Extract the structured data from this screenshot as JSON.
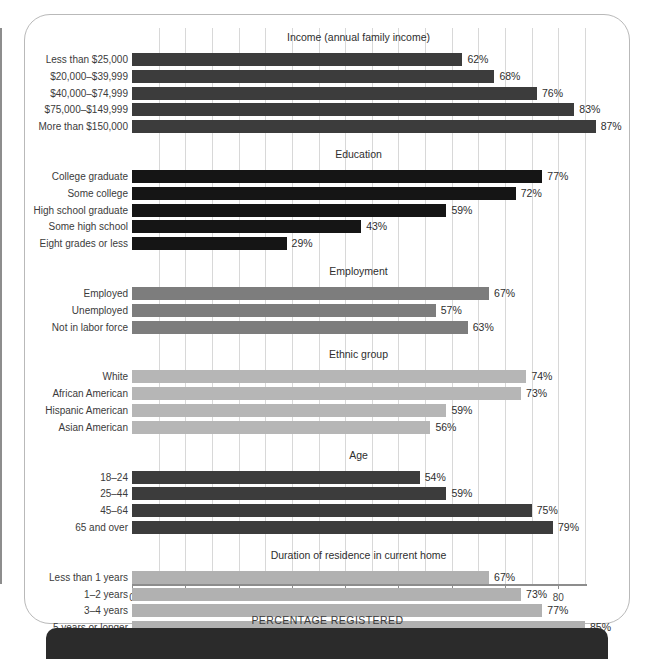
{
  "chart_data": {
    "type": "bar",
    "title": "",
    "xlabel": "PERCENTAGE REGISTERED",
    "ylabel": "",
    "xlim": [
      0,
      85
    ],
    "xticks": [
      0,
      10,
      20,
      30,
      40,
      50,
      60,
      70,
      80
    ],
    "xtick_labels": [
      "0",
      "10",
      "20",
      "30",
      "40",
      "50",
      "60",
      "70",
      "80"
    ],
    "minor_tick_step": 5,
    "grid": true,
    "orientation": "horizontal",
    "legend": "none",
    "value_suffix": "%",
    "groups": [
      {
        "name": "Income (annual family income)",
        "color": "#3c3c3c",
        "categories": [
          "Less than $25,000",
          "$20,000–$39,999",
          "$40,000–$74,999",
          "$75,000–$149,999",
          "More than $150,000"
        ],
        "values": [
          62,
          68,
          76,
          83,
          87
        ],
        "labels": [
          "62%",
          "68%",
          "76%",
          "83%",
          "87%"
        ]
      },
      {
        "name": "Education",
        "color": "#151515",
        "categories": [
          "College graduate",
          "Some college",
          "High school graduate",
          "Some high school",
          "Eight grades or less"
        ],
        "values": [
          77,
          72,
          59,
          43,
          29
        ],
        "labels": [
          "77%",
          "72%",
          "59%",
          "43%",
          "29%"
        ]
      },
      {
        "name": "Employment",
        "color": "#7d7d7d",
        "categories": [
          "Employed",
          "Unemployed",
          "Not in labor force"
        ],
        "values": [
          67,
          57,
          63
        ],
        "labels": [
          "67%",
          "57%",
          "63%"
        ]
      },
      {
        "name": "Ethnic group",
        "color": "#b6b6b6",
        "categories": [
          "White",
          "African American",
          "Hispanic American",
          "Asian American"
        ],
        "values": [
          74,
          73,
          59,
          56
        ],
        "labels": [
          "74%",
          "73%",
          "59%",
          "56%"
        ]
      },
      {
        "name": "Age",
        "color": "#3c3c3c",
        "categories": [
          "18–24",
          "25–44",
          "45–64",
          "65 and over"
        ],
        "values": [
          54,
          59,
          75,
          79
        ],
        "labels": [
          "54%",
          "59%",
          "75%",
          "79%"
        ]
      },
      {
        "name": "Duration of residence in current home",
        "color": "#b1b1b1",
        "categories": [
          "Less than 1 years",
          "1–2 years",
          "3–4 years",
          "5 years or longer"
        ],
        "values": [
          67,
          73,
          77,
          85
        ],
        "labels": [
          "67%",
          "73%",
          "77%",
          "85%"
        ]
      }
    ]
  }
}
